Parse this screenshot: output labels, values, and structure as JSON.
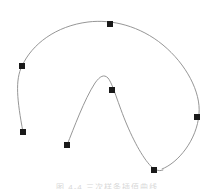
{
  "figure": {
    "background_color": "#ffffff",
    "caption": "图 4-4   三次样条插值曲线",
    "caption_color": "#b9b9b9",
    "width": 214,
    "height": 189
  },
  "curve": {
    "name": "spline-curve",
    "stroke_color": "#8a8a8a",
    "stroke_width": 0.9,
    "outer_path": "M 23 132 C 17 100 15 80 22 66 C 32 44 56 26 88 22 C 112 19 140 26 163 45 C 186 64 201 92 199 114 C 197 140 178 163 162 169",
    "inner_path": "M 67 145 C 74 128 84 100 95 83 C 100 76 104 74 108 78 C 113 84 118 104 127 125 C 136 146 146 163 154 169",
    "join_path": "M 154 169 C 158 171 161 171 163 170"
  },
  "chart_data": {
    "type": "line",
    "xlabel": "",
    "ylabel": "",
    "xlim": [
      0,
      214
    ],
    "ylim": [
      189,
      0
    ],
    "grid": false,
    "legend": "none",
    "series": [
      {
        "name": "outer-spline",
        "points": [
          [
            23,
            132
          ],
          [
            22,
            66
          ],
          [
            110,
            24
          ],
          [
            197,
            117
          ],
          [
            154,
            170
          ]
        ]
      },
      {
        "name": "inner-spline",
        "points": [
          [
            67,
            145
          ],
          [
            95,
            76
          ],
          [
            112,
            90
          ],
          [
            154,
            170
          ]
        ]
      }
    ]
  },
  "control_points": {
    "marker_color": "#1a1a1a",
    "marker_size": 6,
    "items": [
      {
        "id": "p1",
        "label": "P1",
        "x": 22,
        "y": 66,
        "role": "endpoint-left-upper"
      },
      {
        "id": "p2",
        "label": "P2",
        "x": 110,
        "y": 24,
        "role": "knot-top"
      },
      {
        "id": "p3",
        "label": "P3",
        "x": 197,
        "y": 117,
        "role": "knot-right"
      },
      {
        "id": "p4",
        "label": "P4",
        "x": 154,
        "y": 170,
        "role": "knot-bottom-right"
      },
      {
        "id": "p5",
        "label": "P5",
        "x": 112,
        "y": 90,
        "role": "knot-inner-peak"
      },
      {
        "id": "p6",
        "label": "P6",
        "x": 67,
        "y": 145,
        "role": "endpoint-inner-start"
      },
      {
        "id": "p7",
        "label": "P7",
        "x": 23,
        "y": 132,
        "role": "endpoint-left-lower"
      }
    ]
  }
}
